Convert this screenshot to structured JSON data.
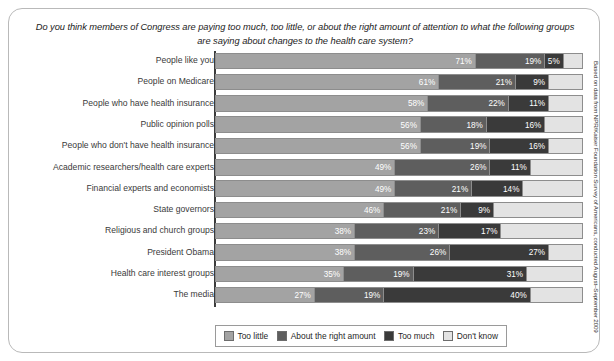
{
  "chart_data": {
    "type": "bar",
    "subtype": "stacked-horizontal-100",
    "title": "Do you think members of Congress are paying too much, too little, or about the right amount of attention to what the following groups are saying about changes to the health care system?",
    "xlabel": "",
    "ylabel": "",
    "xlim": [
      0,
      100
    ],
    "grid": false,
    "legend_position": "bottom",
    "categories": [
      "People like you",
      "People on Medicare",
      "People who have health insurance",
      "Public opinion polls",
      "People who don't have health insurance",
      "Academic researchers/health care experts",
      "Financial experts and economists",
      "State governors",
      "Religious and church groups",
      "President Obama",
      "Health care interest groups",
      "The media"
    ],
    "series": [
      {
        "name": "Too little",
        "color": "#a3a3a3",
        "values": [
          71,
          61,
          58,
          56,
          56,
          49,
          49,
          46,
          38,
          38,
          35,
          27
        ]
      },
      {
        "name": "About the right amount",
        "color": "#5e5e5e",
        "values": [
          19,
          21,
          22,
          18,
          19,
          26,
          21,
          21,
          23,
          26,
          19,
          19
        ]
      },
      {
        "name": "Too much",
        "color": "#3a3a3a",
        "values": [
          5,
          9,
          11,
          16,
          16,
          11,
          14,
          9,
          17,
          27,
          31,
          40
        ]
      },
      {
        "name": "Don't know",
        "color": "#e3e3e3",
        "values": [
          5,
          9,
          9,
          10,
          9,
          14,
          16,
          24,
          22,
          9,
          15,
          14
        ]
      }
    ],
    "value_labels": [
      [
        "71%",
        "19%",
        "5%",
        ""
      ],
      [
        "61%",
        "21%",
        "9%",
        ""
      ],
      [
        "58%",
        "22%",
        "11%",
        ""
      ],
      [
        "56%",
        "18%",
        "16%",
        ""
      ],
      [
        "56%",
        "19%",
        "16%",
        ""
      ],
      [
        "49%",
        "26%",
        "11%",
        ""
      ],
      [
        "49%",
        "21%",
        "14%",
        ""
      ],
      [
        "46%",
        "21%",
        "9%",
        ""
      ],
      [
        "38%",
        "23%",
        "17%",
        ""
      ],
      [
        "38%",
        "26%",
        "27%",
        ""
      ],
      [
        "35%",
        "19%",
        "31%",
        ""
      ],
      [
        "27%",
        "19%",
        "40%",
        ""
      ]
    ],
    "source_note": "Based on data from NPR/Kaiser Foundation Survey of Americans, conducted August–September 2009"
  }
}
